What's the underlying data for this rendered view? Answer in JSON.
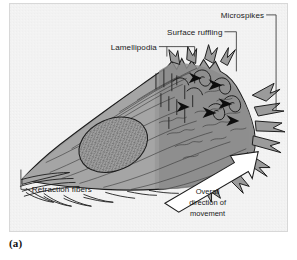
{
  "figure": {
    "caption": "(a)",
    "panel_background": "#f2f2f2",
    "border_color": "#d8d8d8"
  },
  "colors": {
    "cell_body": "#9a9a9a",
    "cell_body_light": "#b0b0b0",
    "cell_shadow": "#8a8a8a",
    "nucleus": "#9e9e9e",
    "outline": "#1d1d1d",
    "label_text": "#1a1a1a",
    "arrow_fill": "#ffffff",
    "leader_line": "#2a2a2a"
  },
  "labels": {
    "microspikes": "Microspikes",
    "surface_ruffling": "Surface ruffling",
    "lamellipodia": "Lamellipodia",
    "retraction_fibers": "Retraction fibers"
  },
  "direction_arrow": {
    "line1": "Overall",
    "line2": "direction of",
    "line3": "movement"
  },
  "icons": {
    "ruffle_arrowhead": "ruffle-arrowhead-icon",
    "direction_arrow": "direction-arrow-icon",
    "nucleus": "nucleus-icon"
  }
}
